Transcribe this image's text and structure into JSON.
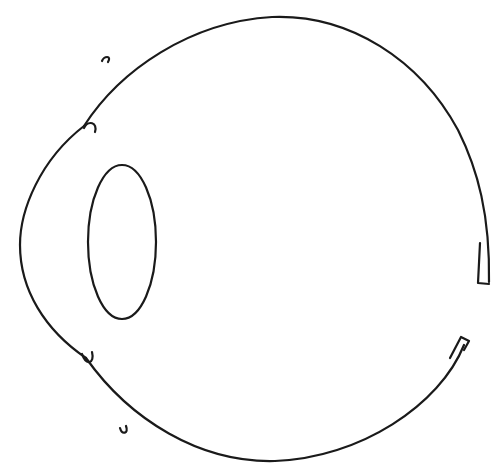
{
  "diagram": {
    "labels": [],
    "stroke_color": "#1a1a1a",
    "background_color": "#ffffff",
    "parts": [
      {
        "name": "sclera-outline"
      },
      {
        "name": "cornea"
      },
      {
        "name": "lens"
      },
      {
        "name": "ciliary-hook-top"
      },
      {
        "name": "ciliary-hook-bottom"
      },
      {
        "name": "label-tick-top"
      },
      {
        "name": "label-tick-bottom"
      },
      {
        "name": "optic-nerve-gap"
      }
    ]
  }
}
